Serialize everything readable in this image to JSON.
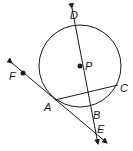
{
  "diagram": {
    "type": "circle geometry",
    "circle": {
      "center_label": "P",
      "center": [
        80,
        66
      ],
      "radius": 41
    },
    "points": [
      {
        "label": "D",
        "x": 76,
        "y": 25,
        "label_x": 71,
        "label_y": 17
      },
      {
        "label": "P",
        "x": 80,
        "y": 66,
        "label_x": 85,
        "label_y": 70
      },
      {
        "label": "C",
        "x": 118,
        "y": 85,
        "label_x": 121,
        "label_y": 92
      },
      {
        "label": "A",
        "x": 55,
        "y": 100,
        "label_x": 44,
        "label_y": 108
      },
      {
        "label": "B",
        "x": 90,
        "y": 107,
        "label_x": 92,
        "label_y": 118
      },
      {
        "label": "E",
        "x": 96,
        "y": 131,
        "label_x": 97,
        "label_y": 132
      },
      {
        "label": "F",
        "x": 23,
        "y": 73,
        "label_x": 11,
        "label_y": 80
      }
    ],
    "lines": [
      {
        "name": "line DE",
        "through": [
          "D",
          "P",
          "B",
          "E"
        ],
        "arrows": "both"
      },
      {
        "name": "line FE (tangent at A)",
        "through": [
          "F",
          "A",
          "E"
        ],
        "arrows": "both"
      }
    ],
    "segments": [
      {
        "name": "chord AC",
        "endpoints": [
          "A",
          "C"
        ]
      }
    ],
    "labels": {
      "D": "D",
      "P": "P",
      "C": "C",
      "A": "A",
      "B": "B",
      "E": "E",
      "F": "F"
    }
  }
}
